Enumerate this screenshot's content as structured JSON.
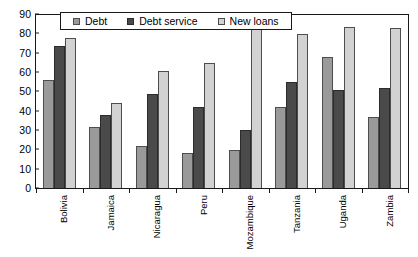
{
  "chart_data": {
    "type": "bar",
    "title": "",
    "xlabel": "",
    "ylabel": "",
    "ylim": [
      0,
      90
    ],
    "ytick_step": 10,
    "yticks": [
      90,
      80,
      70,
      60,
      50,
      40,
      30,
      20,
      10,
      0
    ],
    "grid": false,
    "legend_position": "top-center",
    "categories": [
      "Bolivia",
      "Jamaica",
      "Nicaragua",
      "Peru",
      "Mozambique",
      "Tanzania",
      "Uganda",
      "Zambia"
    ],
    "series": [
      {
        "name": "Debt",
        "color": "#9a9a9a",
        "values": [
          56,
          32,
          22,
          18,
          20,
          42,
          68,
          37
        ]
      },
      {
        "name": "Debt service",
        "color": "#4a4a4a",
        "values": [
          74,
          38,
          49,
          42,
          30,
          55,
          51,
          52
        ]
      },
      {
        "name": "New loans",
        "color": "#d2d2d2",
        "values": [
          78,
          44,
          61,
          65,
          84,
          80,
          84,
          83
        ]
      }
    ]
  },
  "legend": {
    "items": [
      {
        "label": "Debt",
        "swatch": "legend-swatch-debt"
      },
      {
        "label": "Debt service",
        "swatch": "legend-swatch-debt-service"
      },
      {
        "label": "New loans",
        "swatch": "legend-swatch-new-loans"
      }
    ]
  }
}
